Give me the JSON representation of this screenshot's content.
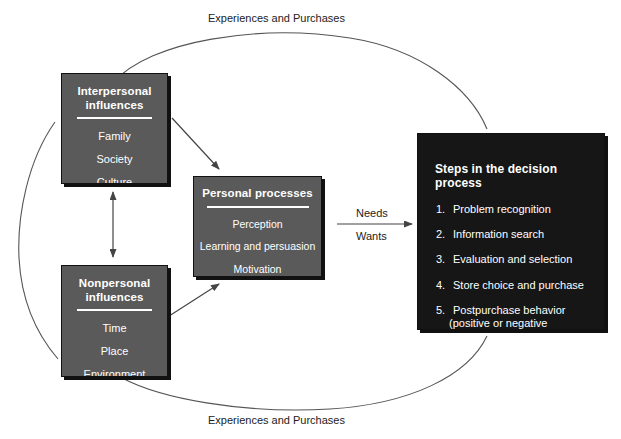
{
  "diagram": {
    "colors": {
      "influence_box": "#5a5a5a",
      "process_box": "#5a5a5a",
      "decision_box": "#161616",
      "background": "#ffffff",
      "line": "#555555",
      "text_on_box": "#ffffff",
      "label_text": "#222222"
    }
  },
  "interpersonal": {
    "title_line1": "Interpersonal",
    "title_line2": "influences",
    "items": [
      "Family",
      "Society",
      "Culture"
    ]
  },
  "nonpersonal": {
    "title_line1": "Nonpersonal",
    "title_line2": "influences",
    "items": [
      "Time",
      "Place",
      "Environment"
    ]
  },
  "personal": {
    "title": "Personal processes",
    "items": [
      "Perception",
      "Learning and persuasion",
      "Motivation"
    ]
  },
  "decision": {
    "title": "Steps in the decision process",
    "steps": [
      {
        "num": "1.",
        "text": "Problem recognition",
        "sub": ""
      },
      {
        "num": "2.",
        "text": "Information search",
        "sub": ""
      },
      {
        "num": "3.",
        "text": "Evaluation and selection",
        "sub": ""
      },
      {
        "num": "4.",
        "text": "Store choice and purchase",
        "sub": ""
      },
      {
        "num": "5.",
        "text": "Postpurchase behavior",
        "sub": "(positive or negative experience)"
      }
    ]
  },
  "labels": {
    "top_arc": "Experiences and Purchases",
    "bottom_arc": "Experiences and Purchases",
    "needs": "Needs",
    "wants": "Wants"
  }
}
